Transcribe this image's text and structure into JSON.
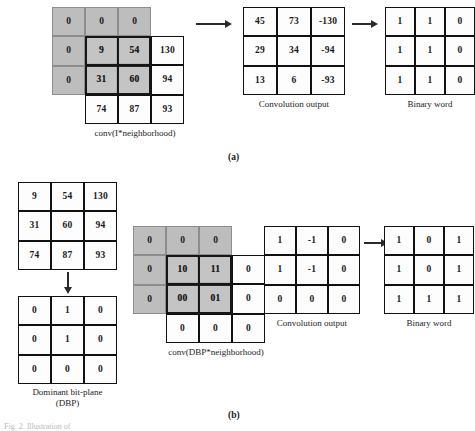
{
  "figure": {
    "panel_a_label": "(a)",
    "panel_b_label": "(b)",
    "bottom_caption": "Fig. 2. Illustration of"
  },
  "panel_a": {
    "neighborhood": {
      "caption": "conv(I*neighborhood)",
      "padding_value": "0",
      "padding_row": [
        "0",
        "0",
        "0"
      ],
      "padding_col": [
        "0",
        "0"
      ],
      "values": [
        [
          "9",
          "54",
          "130"
        ],
        [
          "31",
          "60",
          "94"
        ],
        [
          "74",
          "87",
          "93"
        ]
      ]
    },
    "convolution_output": {
      "caption": "Convolution output",
      "values": [
        [
          "45",
          "73",
          "-130"
        ],
        [
          "29",
          "34",
          "-94"
        ],
        [
          "13",
          "6",
          "-93"
        ]
      ]
    },
    "binary_word": {
      "caption": "Binary word",
      "values": [
        [
          "1",
          "1",
          "0"
        ],
        [
          "1",
          "1",
          "0"
        ],
        [
          "1",
          "1",
          "0"
        ]
      ]
    }
  },
  "panel_b": {
    "source_grid": {
      "values": [
        [
          "9",
          "54",
          "130"
        ],
        [
          "31",
          "60",
          "94"
        ],
        [
          "74",
          "87",
          "93"
        ]
      ]
    },
    "dbp": {
      "caption_line1": "Dominant bit-plane",
      "caption_line2": "(DBP)",
      "values": [
        [
          "0",
          "1",
          "0"
        ],
        [
          "0",
          "1",
          "0"
        ],
        [
          "0",
          "0",
          "0"
        ]
      ]
    },
    "neighborhood": {
      "caption": "conv(DBP*neighborhood)",
      "padding_value": "0",
      "padding_row": [
        "0",
        "0",
        "0"
      ],
      "padding_col": [
        "0",
        "0"
      ],
      "values": [
        [
          "10",
          "11",
          "0"
        ],
        [
          "00",
          "01",
          "0"
        ],
        [
          "0",
          "0",
          "0"
        ]
      ]
    },
    "convolution_output": {
      "caption": "Convolution output",
      "values": [
        [
          "1",
          "-1",
          "0"
        ],
        [
          "1",
          "-1",
          "0"
        ],
        [
          "0",
          "0",
          "0"
        ]
      ]
    },
    "binary_word": {
      "caption": "Binary word",
      "values": [
        [
          "1",
          "0",
          "1"
        ],
        [
          "1",
          "0",
          "1"
        ],
        [
          "1",
          "1",
          "1"
        ]
      ]
    }
  },
  "colors": {
    "shade": "#bdbdbd",
    "border": "#111111",
    "arrow": "#2a2a2a"
  }
}
